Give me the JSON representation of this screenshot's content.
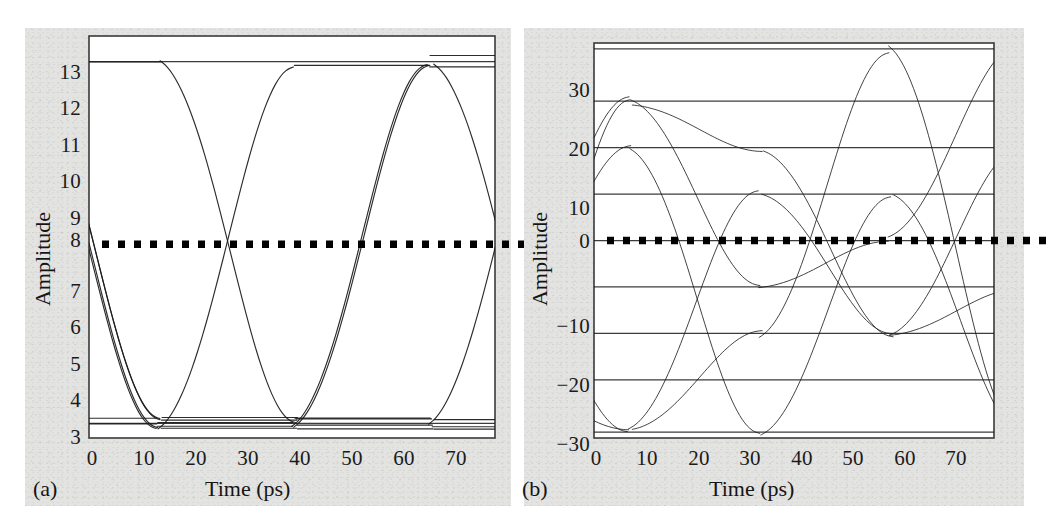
{
  "figure": {
    "background_color": "#ffffff",
    "panel_background_color": "#e3e3e1",
    "trace_color": "#1a1a1a",
    "threshold_color": "#000000",
    "frame_color": "#3a3a3a"
  },
  "panels": [
    {
      "tag": "(a)",
      "xlabel": "Time (ps)",
      "ylabel": "Amplitude",
      "xticks": [
        "0",
        "10",
        "20",
        "30",
        "40",
        "50",
        "60",
        "70"
      ],
      "yticks": [
        "3",
        "4",
        "5",
        "6",
        "7",
        "8",
        "9",
        "10",
        "11",
        "12",
        "13"
      ]
    },
    {
      "tag": "(b)",
      "xlabel": "Time (ps)",
      "ylabel": "Amplitude",
      "xticks": [
        "0",
        "10",
        "20",
        "30",
        "40",
        "50",
        "60",
        "70"
      ],
      "yticks": [
        "−30",
        "−20",
        "−10",
        "0",
        "10",
        "20",
        "30"
      ]
    }
  ],
  "chart_data": [
    {
      "type": "line",
      "title": "",
      "subtitle": "",
      "panel": "(a)",
      "description": "Binary NRZ eye diagram: overlaid bit transitions forming two open eyes",
      "xlabel": "Time (ps)",
      "ylabel": "Amplitude",
      "xlim": [
        0,
        75
      ],
      "ylim": [
        2.7,
        13.7
      ],
      "xticks": [
        0,
        10,
        20,
        30,
        40,
        50,
        60,
        70
      ],
      "yticks": [
        3,
        4,
        5,
        6,
        7,
        8,
        9,
        10,
        11,
        12,
        13
      ],
      "grid": false,
      "legend": "none",
      "levels": [
        3.1,
        13.0
      ],
      "level_labels": [
        "low (logic 0)",
        "high (logic 1)"
      ],
      "symbol_period_ps": 25,
      "eye_crossing_times_ps": [
        13,
        38,
        63
      ],
      "decision_threshold": {
        "value": 8,
        "style": "dotted",
        "label": "",
        "extends_beyond_axes": true
      },
      "annotations": []
    },
    {
      "type": "line",
      "title": "",
      "subtitle": "",
      "panel": "(b)",
      "description": "Multilevel (PAM) eye diagram: overlaid transitions forming a stack of eyes",
      "xlabel": "Time (ps)",
      "ylabel": "Amplitude",
      "xlim": [
        0,
        77
      ],
      "ylim": [
        -34,
        34
      ],
      "xticks": [
        0,
        10,
        20,
        30,
        40,
        50,
        60,
        70
      ],
      "yticks": [
        -30,
        -20,
        -10,
        0,
        10,
        20,
        30
      ],
      "grid": false,
      "legend": "none",
      "levels": [
        -33,
        -24,
        -16,
        -8,
        0,
        8,
        16,
        24,
        33
      ],
      "level_labels": [
        "L0",
        "L1",
        "L2",
        "L3",
        "L4",
        "L5",
        "L6",
        "L7",
        "L8"
      ],
      "symbol_period_ps": 25,
      "eye_crossing_times_ps": [
        7,
        20,
        32,
        45,
        57,
        70
      ],
      "decision_threshold": {
        "value": 0,
        "style": "dotted",
        "label": "",
        "extends_beyond_axes": true
      },
      "annotations": []
    }
  ]
}
